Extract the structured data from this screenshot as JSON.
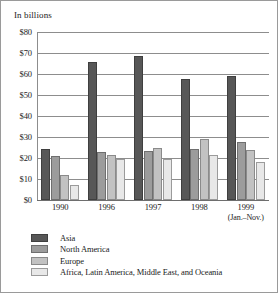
{
  "chart_data": {
    "type": "bar",
    "title": "In billions",
    "xlabel": "",
    "ylabel": "",
    "ylim": [
      0,
      80
    ],
    "ytick_values": [
      0,
      10,
      20,
      30,
      40,
      50,
      60,
      70,
      80
    ],
    "ytick_labels": [
      "$0",
      "$10",
      "$20",
      "$30",
      "$40",
      "$50",
      "$60",
      "$70",
      "$80"
    ],
    "grid": true,
    "legend_position": "bottom-left",
    "categories": [
      "1990",
      "1996",
      "1997",
      "1998",
      "1999"
    ],
    "category_sublabels": [
      "",
      "",
      "",
      "",
      "(Jan.–Nov.)"
    ],
    "series": [
      {
        "name": "Asia",
        "color": "#575757",
        "values": [
          24.5,
          65.8,
          68.5,
          57.5,
          59.0
        ]
      },
      {
        "name": "North America",
        "color": "#9c9c9c",
        "values": [
          21.0,
          23.0,
          23.2,
          24.4,
          27.6
        ]
      },
      {
        "name": "Europe",
        "color": "#c2c2c2",
        "values": [
          12.0,
          21.6,
          24.6,
          29.0,
          23.8
        ]
      },
      {
        "name": "Africa, Latin America, Middle East, and Oceania",
        "color": "#e8e8e8",
        "values": [
          7.0,
          19.6,
          19.6,
          21.5,
          18.2
        ]
      }
    ]
  }
}
